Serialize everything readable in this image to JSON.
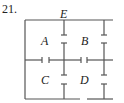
{
  "problem_number": "21.",
  "labels": {
    "A": "A",
    "B": "B",
    "C": "C",
    "D": "D",
    "E": "E"
  },
  "colors": {
    "line": "#555555",
    "text": "#222222"
  }
}
